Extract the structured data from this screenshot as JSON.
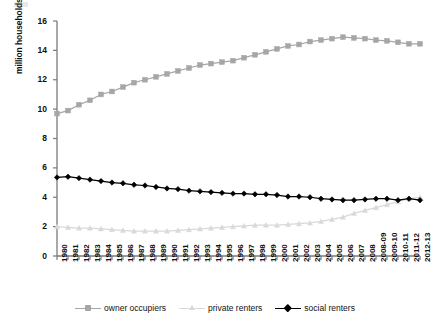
{
  "chart_data": {
    "type": "line",
    "title": "",
    "xlabel": "",
    "ylabel": "million households",
    "ylim": [
      0,
      16
    ],
    "yticks": [
      0,
      2,
      4,
      6,
      8,
      10,
      12,
      14,
      16
    ],
    "grid": false,
    "legend_position": "bottom",
    "categories": [
      "1980",
      "1981",
      "1982",
      "1983",
      "1984",
      "1985",
      "1986",
      "1987",
      "1988",
      "1989",
      "1990",
      "1991",
      "1992",
      "1993",
      "1994",
      "1995",
      "1996",
      "1997",
      "1998",
      "1999",
      "2000",
      "2001",
      "2002",
      "2003",
      "2004",
      "2005",
      "2006",
      "2007",
      "2008",
      "2008-09",
      "2009-10",
      "2010-11",
      "2011-12",
      "2012-13"
    ],
    "series": [
      {
        "name": "owner occupiers",
        "color": "#a6a6a6",
        "marker": "square",
        "values": [
          9.7,
          9.9,
          10.3,
          10.6,
          11.0,
          11.2,
          11.5,
          11.8,
          12.0,
          12.2,
          12.4,
          12.6,
          12.8,
          13.0,
          13.1,
          13.2,
          13.3,
          13.5,
          13.7,
          13.9,
          14.1,
          14.3,
          14.4,
          14.6,
          14.7,
          14.8,
          14.9,
          14.85,
          14.8,
          14.7,
          14.65,
          14.55,
          14.45,
          14.45
        ]
      },
      {
        "name": "private renters",
        "color": "#d9d9d9",
        "marker": "triangle",
        "values": [
          2.0,
          1.95,
          1.9,
          1.9,
          1.85,
          1.8,
          1.75,
          1.7,
          1.7,
          1.7,
          1.7,
          1.75,
          1.8,
          1.85,
          1.9,
          1.95,
          2.0,
          2.05,
          2.1,
          2.1,
          2.1,
          2.15,
          2.2,
          2.25,
          2.35,
          2.5,
          2.65,
          2.9,
          3.1,
          3.3,
          3.5,
          3.7,
          3.9,
          4.0
        ]
      },
      {
        "name": "social renters",
        "color": "#000000",
        "marker": "diamond",
        "values": [
          5.35,
          5.4,
          5.3,
          5.2,
          5.1,
          5.0,
          4.95,
          4.85,
          4.8,
          4.7,
          4.6,
          4.55,
          4.45,
          4.4,
          4.35,
          4.3,
          4.25,
          4.25,
          4.2,
          4.2,
          4.15,
          4.05,
          4.05,
          4.0,
          3.9,
          3.85,
          3.8,
          3.8,
          3.85,
          3.9,
          3.9,
          3.8,
          3.9,
          3.8
        ]
      }
    ]
  },
  "axis": {
    "y_title": "million households"
  }
}
